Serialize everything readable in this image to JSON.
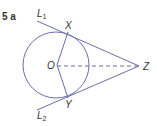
{
  "question": {
    "number_label": "5 a"
  },
  "diagram": {
    "points": {
      "O": "O",
      "X": "X",
      "Y": "Y",
      "Z": "Z"
    },
    "lines": {
      "L1": {
        "letter": "L",
        "sub": "1"
      },
      "L2": {
        "letter": "L",
        "sub": "2"
      }
    },
    "stroke_color": "#6b6fa8"
  }
}
